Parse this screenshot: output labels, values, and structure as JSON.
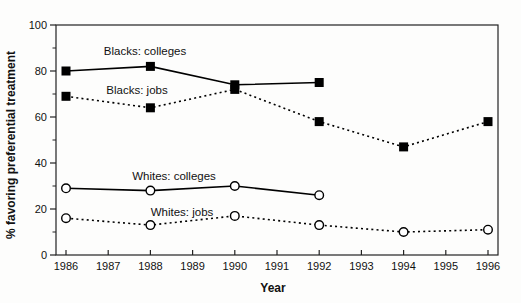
{
  "chart_data": {
    "type": "line",
    "title": "",
    "xlabel": "Year",
    "ylabel": "% favoring preferential treatment",
    "xlim": [
      1986,
      1996
    ],
    "ylim": [
      0,
      100
    ],
    "x_ticks": [
      1986,
      1987,
      1988,
      1989,
      1990,
      1991,
      1992,
      1993,
      1994,
      1995,
      1996
    ],
    "y_ticks": [
      0,
      20,
      40,
      60,
      80,
      100
    ],
    "y_minor_ticks": [
      10,
      30,
      50,
      70,
      90
    ],
    "grid": false,
    "legend": "inline-labels",
    "colors": {
      "foreground": "#000000",
      "background": "#ffffff"
    },
    "series": [
      {
        "name": "Blacks: colleges",
        "marker": "filled-square",
        "line": "solid",
        "x": [
          1986,
          1988,
          1990,
          1992
        ],
        "values": [
          80,
          82,
          74,
          75
        ]
      },
      {
        "name": "Blacks: jobs",
        "marker": "filled-square",
        "line": "dashed",
        "x": [
          1986,
          1988,
          1990,
          1992,
          1994,
          1996
        ],
        "values": [
          69,
          64,
          72,
          58,
          47,
          58
        ]
      },
      {
        "name": "Whites: colleges",
        "marker": "open-circle",
        "line": "solid",
        "x": [
          1986,
          1988,
          1990,
          1992
        ],
        "values": [
          29,
          28,
          30,
          26
        ]
      },
      {
        "name": "Whites: jobs",
        "marker": "open-circle",
        "line": "dashed",
        "x": [
          1986,
          1988,
          1990,
          1992,
          1994,
          1996
        ],
        "values": [
          16,
          13,
          17,
          13,
          10,
          11
        ]
      }
    ]
  }
}
